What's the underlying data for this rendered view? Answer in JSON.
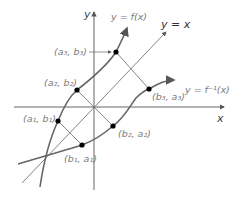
{
  "diagram": {
    "axes": {
      "x_label": "x",
      "y_label": "y"
    },
    "curves": [
      {
        "name": "f",
        "label": "y = f(x)"
      },
      {
        "name": "f_inverse",
        "label": "y = f⁻¹(x)"
      },
      {
        "name": "identity",
        "label": "y = x"
      }
    ],
    "points": [
      {
        "label": "(a₃, b₃)"
      },
      {
        "label": "(a₂, b₂)"
      },
      {
        "label": "(a₁, b₁)"
      },
      {
        "label": "(b₃, a₃)"
      },
      {
        "label": "(b₂, a₂)"
      },
      {
        "label": "(b₁, a₁)"
      }
    ],
    "colors": {
      "curve": "#666666",
      "axis": "#555555",
      "point": "#000000",
      "label": "#7a7a7a"
    }
  }
}
